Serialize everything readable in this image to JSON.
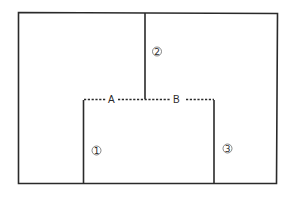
{
  "diagram": {
    "points": [
      {
        "id": "A",
        "label": "A"
      },
      {
        "id": "B",
        "label": "B"
      }
    ],
    "segments": [
      {
        "id": "1",
        "label": "1",
        "description": "left vertical line of inner rectangle"
      },
      {
        "id": "2",
        "label": "2",
        "description": "vertical line from top edge down to dashed line"
      },
      {
        "id": "3",
        "label": "3",
        "description": "right vertical line of inner rectangle"
      }
    ],
    "colors": {
      "line": "#2a2a2a",
      "background": "#ffffff"
    }
  }
}
